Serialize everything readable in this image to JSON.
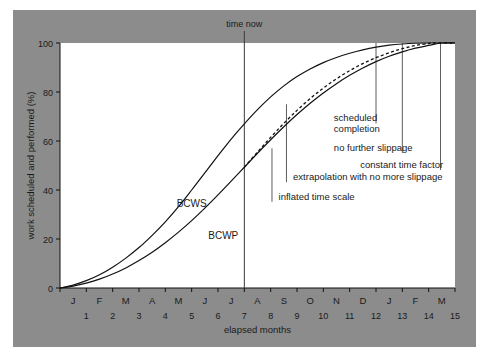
{
  "figure": {
    "background_color": "#8c8c8c",
    "plot_background_color": "#ffffff",
    "line_color": "#111111"
  },
  "chart_data": {
    "type": "line",
    "title": "",
    "xlabel": "elapsed months",
    "ylabel": "work scheduled and performed (%)",
    "xlim": [
      0,
      15
    ],
    "ylim": [
      0,
      100
    ],
    "grid": false,
    "legend": "inline-labels",
    "x_tick_labels_months": [
      "J",
      "F",
      "M",
      "A",
      "M",
      "J",
      "J",
      "A",
      "S",
      "O",
      "N",
      "D",
      "J",
      "F",
      "M"
    ],
    "x_tick_labels_numbers": [
      "1",
      "2",
      "3",
      "4",
      "5",
      "6",
      "7",
      "8",
      "9",
      "10",
      "11",
      "12",
      "13",
      "14",
      "15"
    ],
    "y_tick_labels": [
      "0",
      "20",
      "40",
      "60",
      "80",
      "100"
    ],
    "y_ticks": [
      0,
      20,
      40,
      60,
      80,
      100
    ],
    "series": [
      {
        "name": "BCWS",
        "style": "solid",
        "label": "BCWS",
        "label_x": 5.0,
        "label_y": 33,
        "points": [
          [
            0,
            0
          ],
          [
            0.5,
            1.2
          ],
          [
            1,
            3.0
          ],
          [
            1.5,
            5.4
          ],
          [
            2,
            8.5
          ],
          [
            2.5,
            12.2
          ],
          [
            3,
            16.5
          ],
          [
            3.5,
            21.5
          ],
          [
            4,
            27.0
          ],
          [
            4.5,
            33.2
          ],
          [
            5,
            40.0
          ],
          [
            5.5,
            47.0
          ],
          [
            6,
            54.0
          ],
          [
            6.5,
            60.8
          ],
          [
            7,
            67.0
          ],
          [
            7.5,
            72.8
          ],
          [
            8,
            78.0
          ],
          [
            8.5,
            82.5
          ],
          [
            9,
            86.3
          ],
          [
            9.5,
            89.4
          ],
          [
            10,
            92.0
          ],
          [
            10.5,
            94.1
          ],
          [
            11,
            95.8
          ],
          [
            11.5,
            97.2
          ],
          [
            12,
            98.3
          ],
          [
            12.5,
            99.1
          ],
          [
            13,
            99.6
          ],
          [
            13.5,
            99.9
          ],
          [
            14,
            100
          ],
          [
            15,
            100
          ]
        ]
      },
      {
        "name": "BCWP",
        "style": "solid",
        "label": "BCWP",
        "label_x": 6.2,
        "label_y": 20,
        "points": [
          [
            0,
            0
          ],
          [
            0.5,
            0.8
          ],
          [
            1,
            2.0
          ],
          [
            1.5,
            3.6
          ],
          [
            2,
            5.7
          ],
          [
            2.5,
            8.2
          ],
          [
            3,
            11.2
          ],
          [
            3.5,
            14.6
          ],
          [
            4,
            18.5
          ],
          [
            4.5,
            22.8
          ],
          [
            5,
            27.5
          ],
          [
            5.5,
            32.6
          ],
          [
            6,
            38.0
          ],
          [
            6.5,
            43.6
          ],
          [
            7,
            49.3
          ],
          [
            7.5,
            55.0
          ],
          [
            8,
            60.5
          ],
          [
            8.5,
            65.8
          ],
          [
            9,
            70.8
          ],
          [
            9.5,
            75.4
          ],
          [
            10,
            79.6
          ],
          [
            10.5,
            83.4
          ],
          [
            11,
            86.8
          ],
          [
            11.5,
            89.8
          ],
          [
            12,
            92.4
          ],
          [
            12.5,
            94.6
          ],
          [
            13,
            96.4
          ],
          [
            13.5,
            97.9
          ],
          [
            14,
            99.0
          ],
          [
            14.5,
            100
          ],
          [
            15,
            100
          ]
        ]
      },
      {
        "name": "extrapolation",
        "style": "dashed",
        "label": "",
        "points": [
          [
            7,
            49.3
          ],
          [
            7.5,
            55.5
          ],
          [
            8,
            61.5
          ],
          [
            8.5,
            67.2
          ],
          [
            9,
            72.5
          ],
          [
            9.5,
            77.3
          ],
          [
            10,
            81.6
          ],
          [
            10.5,
            85.4
          ],
          [
            11,
            88.7
          ],
          [
            11.5,
            91.6
          ],
          [
            12,
            94.0
          ],
          [
            12.5,
            96.0
          ],
          [
            13,
            97.7
          ],
          [
            13.5,
            99.0
          ],
          [
            14,
            99.8
          ],
          [
            14.2,
            100
          ],
          [
            15,
            100
          ]
        ]
      }
    ],
    "markers": [
      {
        "name": "time now",
        "label": "time now",
        "x": 7,
        "type": "vline-full",
        "label_position": "top"
      },
      {
        "name": "inflated time scale",
        "label": "inflated time scale",
        "x": 8.05,
        "type": "leader",
        "y_top": 57,
        "label_x": 8.3,
        "label_y": 36
      },
      {
        "name": "extrapolation with no more slippage",
        "label": "extrapolation with no more slippage",
        "x": 8.6,
        "type": "leader",
        "y_top": 75,
        "label_x": 8.85,
        "label_y": 44
      },
      {
        "name": "scheduled completion",
        "label": "scheduled completion",
        "x": 12.0,
        "type": "leader",
        "y_top": 100,
        "label_x": 10.4,
        "label_y": 68
      },
      {
        "name": "no further slippage",
        "label": "no further slippage",
        "x": 13.0,
        "type": "leader",
        "y_top": 100,
        "label_x": 10.4,
        "label_y": 56
      },
      {
        "name": "constant time factor",
        "label": "constant time factor",
        "x": 14.45,
        "type": "leader",
        "y_top": 100,
        "label_x": 11.4,
        "label_y": 49
      }
    ]
  }
}
